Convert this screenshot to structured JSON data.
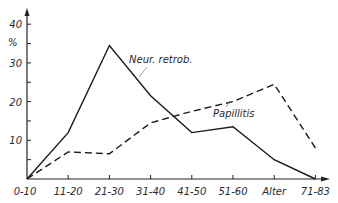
{
  "chart_data": {
    "type": "line",
    "title": "",
    "xlabel": "Alter",
    "ylabel": "%",
    "categories": [
      "0-10",
      "11-20",
      "21-30",
      "31-40",
      "41-50",
      "51-60",
      "Alter",
      "71-83"
    ],
    "x_tick_labels": [
      "0-10",
      "11-20",
      "21-30",
      "31-40",
      "41-50",
      "51-60",
      "Alter",
      "71-83"
    ],
    "y_ticks": [
      10,
      20,
      30,
      40
    ],
    "ylim": [
      0,
      40
    ],
    "grid": false,
    "legend": "inline labels",
    "series": [
      {
        "name": "Neur. retrob.",
        "style": "solid",
        "values": [
          0,
          12,
          34.5,
          21.5,
          12,
          13.5,
          5,
          0
        ]
      },
      {
        "name": "Papillitis",
        "style": "dashed",
        "values": [
          0,
          7,
          6.5,
          14.5,
          17.5,
          20,
          24.5,
          8
        ]
      }
    ]
  },
  "axis": {
    "y_unit": "%",
    "y_tick_labels": [
      "10",
      "20",
      "30",
      "40"
    ]
  },
  "labels": {
    "series1": "Neur. retrob.",
    "series2": "Papillitis"
  }
}
